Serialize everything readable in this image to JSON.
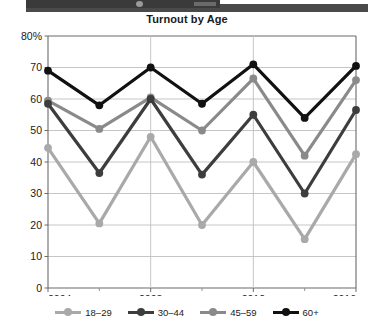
{
  "header": {
    "bar_label": "",
    "bar_color": "#3a3a3a"
  },
  "chart_data": {
    "type": "line",
    "title": "Turnout by Age",
    "xlabel": "",
    "ylabel": "",
    "x": [
      2004,
      2006,
      2008,
      2010,
      2012,
      2014,
      2016
    ],
    "xtick_labels": [
      "2004",
      "2008",
      "2012",
      "2016"
    ],
    "xtick_values": [
      2004,
      2008,
      2012,
      2016
    ],
    "xminor_values": [
      2006,
      2010,
      2014
    ],
    "xlim": [
      2004,
      2016
    ],
    "ylim": [
      0,
      80
    ],
    "ytick_labels": [
      "0",
      "10",
      "20",
      "30",
      "40",
      "50",
      "60",
      "70",
      "80%"
    ],
    "ytick_values": [
      0,
      10,
      20,
      30,
      40,
      50,
      60,
      70,
      80
    ],
    "grid": true,
    "grid_color": "#bfbfbf",
    "legend_position": "bottom",
    "series": [
      {
        "name": "18–29",
        "color": "#a9a9a9",
        "values": [
          44.5,
          20.5,
          48.0,
          20.0,
          40.0,
          15.5,
          42.5
        ]
      },
      {
        "name": "30–44",
        "color": "#3d3d3d",
        "values": [
          58.5,
          36.5,
          60.0,
          36.0,
          55.0,
          30.0,
          56.5
        ]
      },
      {
        "name": "45–59",
        "color": "#8a8a8a",
        "values": [
          59.5,
          50.5,
          60.5,
          50.0,
          66.5,
          42.0,
          66.0
        ]
      },
      {
        "name": "60+",
        "color": "#111111",
        "values": [
          69.0,
          58.0,
          70.0,
          58.5,
          71.0,
          54.0,
          70.5
        ]
      }
    ]
  },
  "legend": {
    "items": [
      {
        "label": "18–29",
        "color": "#a9a9a9"
      },
      {
        "label": "30–44",
        "color": "#3d3d3d"
      },
      {
        "label": "45–59",
        "color": "#8a8a8a"
      },
      {
        "label": "60+",
        "color": "#111111"
      }
    ]
  }
}
